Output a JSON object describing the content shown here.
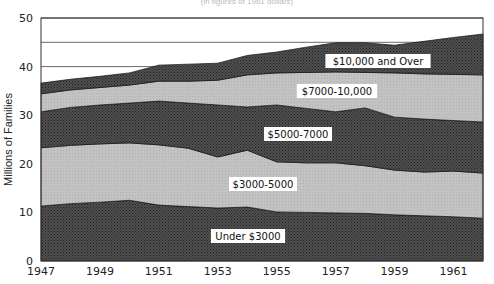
{
  "chart_data": {
    "type": "area",
    "stacked": true,
    "title": "",
    "xlabel": "",
    "ylabel": "Millions of Families",
    "ylim": [
      0,
      50
    ],
    "xlim": [
      1947,
      1962
    ],
    "yticks": [
      0,
      10,
      20,
      30,
      40,
      50
    ],
    "xticks": [
      "1947",
      "1949",
      "1951",
      "1953",
      "1955",
      "1957",
      "1959",
      "1961"
    ],
    "gridlines_y": [
      40,
      45,
      50
    ],
    "legend_position": "inline labels",
    "x": [
      1947,
      1948,
      1949,
      1950,
      1951,
      1952,
      1953,
      1954,
      1955,
      1956,
      1957,
      1958,
      1959,
      1960,
      1961,
      1962
    ],
    "series": [
      {
        "name": "Under $3000",
        "fill": "#3c3c3c",
        "label_pos": [
          248,
          236
        ],
        "values": [
          11.3,
          11.8,
          12.1,
          12.5,
          11.5,
          11.2,
          10.9,
          11.1,
          10.1,
          10.0,
          9.9,
          9.8,
          9.5,
          9.3,
          9.1,
          8.8
        ]
      },
      {
        "name": "$3000-5000",
        "fill": "#bdbdbd",
        "label_pos": [
          263,
          184
        ],
        "values": [
          12.0,
          12.0,
          12.0,
          11.8,
          12.4,
          12.0,
          10.5,
          11.7,
          10.3,
          10.2,
          10.3,
          9.8,
          9.2,
          9.0,
          9.4,
          9.3
        ]
      },
      {
        "name": "$5000-7000",
        "fill": "#464646",
        "label_pos": [
          298,
          134
        ],
        "values": [
          7.4,
          7.8,
          8.0,
          8.2,
          9.0,
          9.3,
          10.7,
          8.9,
          11.7,
          11.2,
          10.5,
          11.9,
          10.9,
          10.9,
          10.4,
          10.5
        ]
      },
      {
        "name": "$7000-10,000",
        "fill": "#c6c6c6",
        "label_pos": [
          337,
          91
        ],
        "values": [
          3.7,
          3.6,
          3.6,
          3.7,
          4.1,
          4.5,
          5.1,
          6.6,
          6.6,
          7.4,
          8.2,
          7.3,
          9.1,
          9.3,
          9.5,
          9.7
        ]
      },
      {
        "name": "$10,000 and Over",
        "fill": "#4a4a4a",
        "label_pos": [
          378,
          61
        ],
        "values": [
          2.2,
          2.2,
          2.3,
          2.5,
          3.3,
          3.5,
          3.5,
          4.0,
          4.3,
          5.2,
          6.0,
          6.1,
          5.7,
          6.7,
          7.6,
          8.4
        ]
      }
    ],
    "totals": [
      36.6,
      37.4,
      38.0,
      38.7,
      40.3,
      40.5,
      40.7,
      42.3,
      43.0,
      44.0,
      44.9,
      44.9,
      44.4,
      45.2,
      46.0,
      46.7
    ]
  },
  "header": {
    "title_fragment": "(in figures of 1961 dollars)"
  }
}
